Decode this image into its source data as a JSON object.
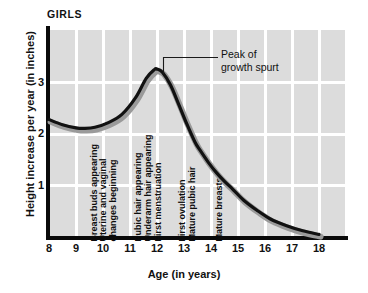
{
  "chart_data": {
    "type": "line",
    "title": "GIRLS",
    "xlabel": "Age (in years)",
    "ylabel": "Height increase per year (in inches)",
    "xlim": [
      8,
      18
    ],
    "ylim": [
      0,
      3.6
    ],
    "xticks": [
      "8",
      "9",
      "10",
      "11",
      "12",
      "13",
      "14",
      "15",
      "16",
      "17",
      "18"
    ],
    "yticks": [
      "1",
      "2",
      "3"
    ],
    "grid": true,
    "legend": "none",
    "series": [
      {
        "name": "Height increase per year",
        "x": [
          8.0,
          8.5,
          9.0,
          9.3,
          9.7,
          10.2,
          10.7,
          11.2,
          11.6,
          11.9,
          12.0,
          12.2,
          12.5,
          12.8,
          13.1,
          13.4,
          13.6,
          13.9,
          14.2,
          14.5,
          14.8,
          15.2,
          15.7,
          16.2,
          16.8,
          17.4,
          18.0
        ],
        "values": [
          2.28,
          2.18,
          2.12,
          2.11,
          2.13,
          2.22,
          2.38,
          2.7,
          3.08,
          3.25,
          3.26,
          3.2,
          2.95,
          2.58,
          2.2,
          1.85,
          1.68,
          1.45,
          1.25,
          1.08,
          0.93,
          0.72,
          0.52,
          0.35,
          0.22,
          0.12,
          0.05
        ]
      }
    ],
    "annotations": [
      {
        "id": "peak-annotation",
        "text": "Peak of\ngrowth spurt",
        "target_x": 12.0,
        "target_y": 3.26
      }
    ],
    "milestones": [
      {
        "id": "breast-buds",
        "label": "Breast buds appearing",
        "age": 10.0
      },
      {
        "id": "uterine-vaginal",
        "label": "Uterine and vaginal",
        "age": 10.35
      },
      {
        "id": "changes-beginning",
        "label": "changes beginning",
        "age": 10.72
      },
      {
        "id": "pubic-hair",
        "label": "Pubic hair appearing",
        "age": 11.62
      },
      {
        "id": "underarm-hair",
        "label": "Underarm hair appearing",
        "age": 12.0
      },
      {
        "id": "first-menstruation",
        "label": "First menstruation",
        "age": 12.38
      },
      {
        "id": "first-ovulation",
        "label": "First ovulation",
        "age": 13.25
      },
      {
        "id": "mature-pubic-hair",
        "label": "Mature pubic hair",
        "age": 13.62
      },
      {
        "id": "mature-breasts",
        "label": "Mature breasts",
        "age": 14.62
      }
    ]
  },
  "style": {
    "plot_background": "#dcdcdc",
    "gridline_color": "#ffffff",
    "axis_color": "#0a0a0a",
    "curve_color": "#111111",
    "curve_shadow_color": "#9a9a9a",
    "text_color": "#111111"
  }
}
